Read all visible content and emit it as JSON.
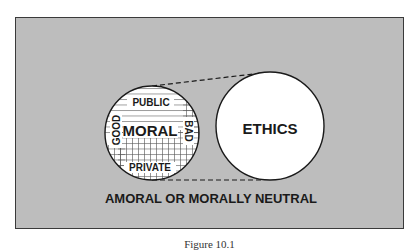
{
  "diagram": {
    "background_label": "AMORAL OR MORALLY NEUTRAL",
    "moral_circle": {
      "center_label": "MORAL",
      "top_label": "PUBLIC",
      "bottom_label": "PRIVATE",
      "left_label": "GOOD",
      "right_label": "BAD"
    },
    "ethics_circle": {
      "label": "ETHICS"
    },
    "colors": {
      "background": "#bdbdbd",
      "circle_fill": "#ffffff",
      "stroke": "#1a1a1a"
    }
  },
  "caption": "Figure 10.1"
}
